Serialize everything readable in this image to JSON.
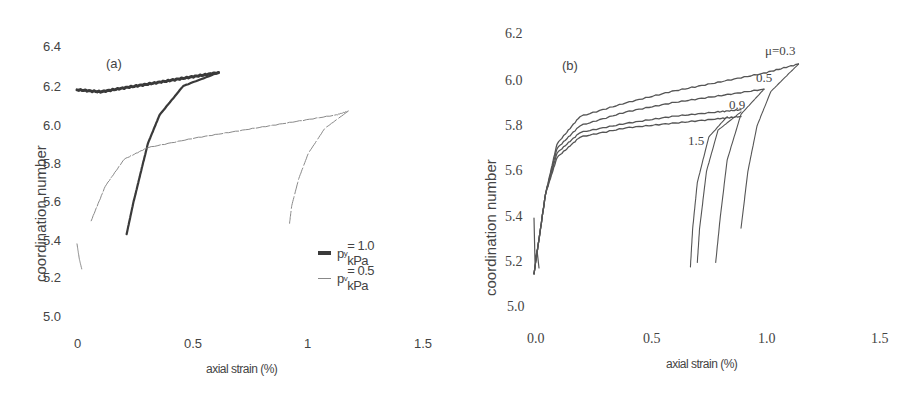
{
  "chart_data": [
    {
      "panel_label": "(a)",
      "type": "line",
      "title": "",
      "xlabel": "axial strain (%)",
      "ylabel": "coordination number",
      "xlim": [
        0,
        1.5
      ],
      "ylim": [
        5.0,
        6.4
      ],
      "x_ticks": [
        "0",
        "0.5",
        "1",
        "1.5"
      ],
      "y_ticks": [
        "6.4",
        "6.2",
        "6.0",
        "5.8",
        "5.6",
        "5.4",
        "5.2",
        "5.0"
      ],
      "grid": false,
      "legend_position": "right-middle",
      "legend": [
        "p_y = 1.0 kPa",
        "p_y = 0.5 kPa"
      ],
      "series": [
        {
          "name": "p_y = 1.0 kPa",
          "style": "thick dark",
          "loading": {
            "x": [
              0.0,
              0.1,
              0.2,
              0.3,
              0.4,
              0.5,
              0.6
            ],
            "y": [
              6.18,
              6.17,
              6.19,
              6.21,
              6.23,
              6.25,
              6.27
            ]
          },
          "unloading": {
            "x": [
              0.6,
              0.45,
              0.35,
              0.3,
              0.27,
              0.24,
              0.21
            ],
            "y": [
              6.27,
              6.2,
              6.05,
              5.9,
              5.75,
              5.6,
              5.43
            ]
          }
        },
        {
          "name": "p_y = 0.5 kPa",
          "style": "thin light",
          "initial": {
            "x": [
              0.0,
              0.01,
              0.02
            ],
            "y": [
              5.38,
              5.3,
              5.25
            ]
          },
          "loading": {
            "x": [
              0.06,
              0.12,
              0.2,
              0.3,
              0.5,
              0.7,
              0.9,
              1.1,
              1.15
            ],
            "y": [
              5.5,
              5.68,
              5.82,
              5.88,
              5.93,
              5.97,
              6.01,
              6.05,
              6.07
            ]
          },
          "unloading": {
            "x": [
              1.15,
              1.05,
              0.98,
              0.94,
              0.91,
              0.9
            ],
            "y": [
              6.07,
              5.98,
              5.85,
              5.72,
              5.58,
              5.48
            ]
          }
        }
      ]
    },
    {
      "panel_label": "(b)",
      "type": "line",
      "title": "",
      "xlabel": "axial strain (%)",
      "ylabel": "coordination number",
      "xlim": [
        0,
        1.5
      ],
      "ylim": [
        5.0,
        6.2
      ],
      "x_ticks": [
        "0.0",
        "0.5",
        "1.0",
        "1.5"
      ],
      "y_ticks": [
        "6.2",
        "6.0",
        "5.8",
        "5.6",
        "5.4",
        "5.2",
        "5.0"
      ],
      "grid": false,
      "annotations": [
        "μ=0.3",
        "0.5",
        "0.9",
        "1.5"
      ],
      "series": [
        {
          "name": "μ=0.3",
          "loading": {
            "x": [
              0.0,
              0.05,
              0.1,
              0.2,
              0.4,
              0.6,
              0.8,
              1.0,
              1.15
            ],
            "y": [
              5.15,
              5.5,
              5.72,
              5.84,
              5.9,
              5.95,
              5.99,
              6.03,
              6.07
            ]
          },
          "unloading": {
            "x": [
              1.15,
              1.03,
              0.97,
              0.93,
              0.9
            ],
            "y": [
              6.07,
              5.95,
              5.8,
              5.6,
              5.35
            ]
          }
        },
        {
          "name": "μ=0.5",
          "loading": {
            "x": [
              0.0,
              0.05,
              0.1,
              0.2,
              0.4,
              0.6,
              0.8,
              1.0
            ],
            "y": [
              5.15,
              5.5,
              5.7,
              5.8,
              5.86,
              5.9,
              5.93,
              5.96
            ]
          },
          "unloading": {
            "x": [
              1.0,
              0.9,
              0.84,
              0.81,
              0.79
            ],
            "y": [
              5.96,
              5.85,
              5.65,
              5.4,
              5.2
            ]
          }
        },
        {
          "name": "μ=0.9",
          "loading": {
            "x": [
              0.0,
              0.05,
              0.1,
              0.2,
              0.4,
              0.6,
              0.8,
              0.9
            ],
            "y": [
              5.15,
              5.5,
              5.68,
              5.77,
              5.81,
              5.84,
              5.86,
              5.87
            ]
          },
          "unloading": {
            "x": [
              0.9,
              0.8,
              0.75,
              0.72,
              0.71
            ],
            "y": [
              5.86,
              5.78,
              5.6,
              5.35,
              5.2
            ]
          }
        },
        {
          "name": "μ=1.5",
          "loading": {
            "x": [
              0.0,
              0.05,
              0.1,
              0.2,
              0.4,
              0.6,
              0.8,
              0.9
            ],
            "y": [
              5.15,
              5.5,
              5.66,
              5.75,
              5.79,
              5.81,
              5.83,
              5.84
            ]
          },
          "unloading": {
            "x": [
              0.84,
              0.76,
              0.71,
              0.69,
              0.68
            ],
            "y": [
              5.84,
              5.75,
              5.55,
              5.35,
              5.18
            ]
          }
        }
      ]
    }
  ],
  "panel_a": {
    "label": "(a)",
    "ylabel": "coordination number",
    "xlabel": "axial strain (%)",
    "y_ticks": [
      "6.4",
      "6.2",
      "6.0",
      "5.8",
      "5.6",
      "5.4",
      "5.2",
      "5.0"
    ],
    "x_ticks": [
      "0",
      "0.5",
      "1",
      "1.5"
    ],
    "legend": [
      {
        "label": "p",
        "sub": "y",
        "rest": " = 1.0 kPa",
        "color": "#444444"
      },
      {
        "label": "p",
        "sub": "v",
        "rest": " = 0.5 kPa",
        "color": "#888888"
      }
    ]
  },
  "panel_b": {
    "label": "(b)",
    "ylabel": "coordination number",
    "xlabel": "axial strain (%)",
    "y_ticks": [
      "6.2",
      "6.0",
      "5.8",
      "5.6",
      "5.4",
      "5.2",
      "5.0"
    ],
    "x_ticks": [
      "0.0",
      "0.5",
      "1.0",
      "1.5"
    ],
    "annotations": {
      "mu03": "μ=0.3",
      "mu05": "0.5",
      "mu09": "0.9",
      "mu15": "1.5"
    }
  },
  "colors": {
    "thick_line": "#3a3a3a",
    "thin_line": "#8a8a8a",
    "curve_b": "#555555",
    "text": "#444444"
  }
}
